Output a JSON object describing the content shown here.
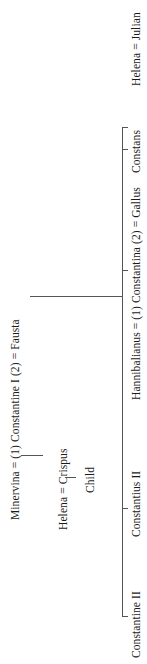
{
  "diagram": {
    "type": "family-tree",
    "orientation": "rotated-90-ccw",
    "generation1": {
      "line": "Minervina = (1) Constantine I (2) = Fausta",
      "persons": [
        "Minervina",
        "Constantine I",
        "Fausta"
      ],
      "marriages": [
        {
          "order": "(1)",
          "spouse": "Minervina"
        },
        {
          "order": "(2)",
          "spouse": "Fausta"
        }
      ]
    },
    "first_marriage_branch": {
      "line": "Helena = Crispus",
      "child": "Child"
    },
    "second_marriage_children": [
      {
        "label": "Constantine II"
      },
      {
        "label": "Constantius II"
      },
      {
        "label": "Hannibalianus = (1) Constantina (2) = Gallus"
      },
      {
        "label": "Constans"
      },
      {
        "label": "Helena = Julian"
      }
    ]
  }
}
